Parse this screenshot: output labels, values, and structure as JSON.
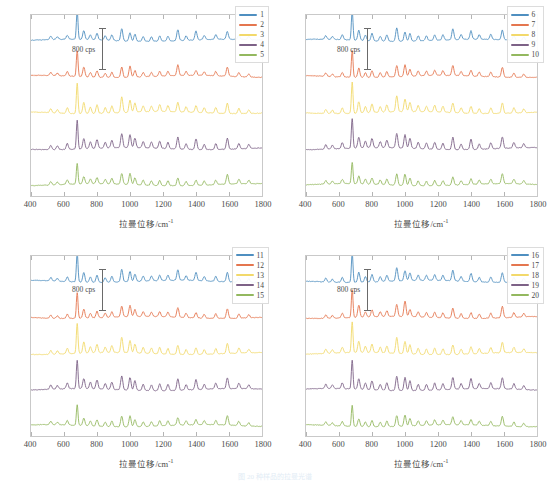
{
  "figure": {
    "caption": "图 20 种样品的拉曼光谱",
    "background_color": "#ffffff",
    "frame_color": "#c9c9c9"
  },
  "axis": {
    "x_title_main": "拉曼位移/cm",
    "x_title_sup": "-1",
    "x_ticks": [
      "400",
      "600",
      "800",
      "1000",
      "1200",
      "1400",
      "1600",
      "1800"
    ],
    "x_min": 400,
    "x_max": 1800,
    "y_ticks_shown": false
  },
  "scalebar": {
    "label": "800 cps"
  },
  "series_colors": {
    "c1": "#4f8fc0",
    "c2": "#e4764f",
    "c3": "#f2d96b",
    "c4": "#7d6287",
    "c5": "#93b85f"
  },
  "panels": [
    {
      "id": "panel-top-left",
      "legend": [
        {
          "label": "1",
          "color": "#4f8fc0"
        },
        {
          "label": "2",
          "color": "#e4764f"
        },
        {
          "label": "3",
          "color": "#f2d96b"
        },
        {
          "label": "4",
          "color": "#7d6287"
        },
        {
          "label": "5",
          "color": "#93b85f"
        }
      ]
    },
    {
      "id": "panel-top-right",
      "legend": [
        {
          "label": "6",
          "color": "#4f8fc0"
        },
        {
          "label": "7",
          "color": "#e4764f"
        },
        {
          "label": "8",
          "color": "#f2d96b"
        },
        {
          "label": "9",
          "color": "#7d6287"
        },
        {
          "label": "10",
          "color": "#93b85f"
        }
      ]
    },
    {
      "id": "panel-bottom-left",
      "legend": [
        {
          "label": "11",
          "color": "#4f8fc0"
        },
        {
          "label": "12",
          "color": "#e4764f"
        },
        {
          "label": "13",
          "color": "#f2d96b"
        },
        {
          "label": "14",
          "color": "#7d6287"
        },
        {
          "label": "15",
          "color": "#93b85f"
        }
      ]
    },
    {
      "id": "panel-bottom-right",
      "legend": [
        {
          "label": "16",
          "color": "#4f8fc0"
        },
        {
          "label": "17",
          "color": "#e4764f"
        },
        {
          "label": "18",
          "color": "#f2d96b"
        },
        {
          "label": "19",
          "color": "#7d6287"
        },
        {
          "label": "20",
          "color": "#93b85f"
        }
      ]
    }
  ],
  "chart_data": {
    "type": "line",
    "title": "",
    "xlabel": "拉曼位移/cm-1",
    "ylabel": "",
    "xlim": [
      400,
      1800
    ],
    "grid": false,
    "legend_position": "top-right",
    "y_axis_labeled": false,
    "scale_bar": "800 cps",
    "note": "Four stacked-offset Raman spectra panels; each panel holds 5 traces offset vertically. Intensity in arbitrary counts per second; peak list gives Raman shift (cm-1) and relative peak height in cps above local baseline.",
    "peak_positions_cm1": [
      520,
      560,
      620,
      680,
      720,
      760,
      800,
      850,
      890,
      950,
      1000,
      1030,
      1080,
      1130,
      1180,
      1230,
      1290,
      1340,
      1400,
      1450,
      1520,
      1590,
      1660,
      1720
    ],
    "panels": [
      {
        "name": "panel-top-left",
        "series": [
          {
            "name": "1",
            "color": "#4f8fc0",
            "offset": 4,
            "peaks_cps": [
              90,
              70,
              110,
              760,
              240,
              130,
              180,
              120,
              150,
              330,
              220,
              190,
              130,
              120,
              140,
              130,
              300,
              120,
              240,
              110,
              130,
              210,
              120,
              90
            ]
          },
          {
            "name": "2",
            "color": "#e4764f",
            "offset": 3,
            "peaks_cps": [
              80,
              70,
              120,
              700,
              260,
              120,
              170,
              110,
              140,
              280,
              300,
              180,
              120,
              110,
              130,
              120,
              290,
              110,
              130,
              100,
              120,
              250,
              110,
              80
            ]
          },
          {
            "name": "3",
            "color": "#f2d96b",
            "offset": 2,
            "peaks_cps": [
              110,
              90,
              150,
              820,
              300,
              170,
              230,
              150,
              190,
              420,
              330,
              240,
              160,
              150,
              180,
              160,
              250,
              140,
              180,
              130,
              150,
              280,
              140,
              100
            ]
          },
          {
            "name": "4",
            "color": "#7d6287",
            "offset": 1,
            "peaks_cps": [
              120,
              100,
              160,
              780,
              280,
              180,
              240,
              160,
              200,
              380,
              350,
              260,
              170,
              160,
              190,
              170,
              320,
              150,
              290,
              140,
              160,
              300,
              150,
              110
            ]
          },
          {
            "name": "5",
            "color": "#93b85f",
            "offset": 0,
            "peaks_cps": [
              90,
              70,
              120,
              560,
              200,
              130,
              170,
              120,
              150,
              290,
              300,
              190,
              130,
              120,
              140,
              130,
              210,
              110,
              140,
              110,
              120,
              260,
              120,
              90
            ]
          }
        ]
      },
      {
        "name": "panel-top-right",
        "series": [
          {
            "name": "6",
            "color": "#4f8fc0",
            "offset": 4,
            "peaks_cps": [
              100,
              80,
              130,
              800,
              270,
              150,
              200,
              130,
              170,
              360,
              250,
              210,
              140,
              130,
              150,
              140,
              290,
              130,
              230,
              120,
              140,
              260,
              130,
              100
            ]
          },
          {
            "name": "7",
            "color": "#e4764f",
            "offset": 3,
            "peaks_cps": [
              90,
              70,
              120,
              720,
              250,
              130,
              180,
              120,
              150,
              300,
              310,
              190,
              130,
              120,
              140,
              130,
              270,
              120,
              150,
              110,
              130,
              270,
              120,
              90
            ]
          },
          {
            "name": "8",
            "color": "#f2d96b",
            "offset": 2,
            "peaks_cps": [
              110,
              90,
              150,
              840,
              310,
              170,
              230,
              150,
              190,
              430,
              340,
              250,
              160,
              150,
              180,
              160,
              260,
              140,
              190,
              130,
              150,
              290,
              140,
              100
            ]
          },
          {
            "name": "9",
            "color": "#7d6287",
            "offset": 1,
            "peaks_cps": [
              120,
              100,
              160,
              800,
              290,
              180,
              250,
              160,
              200,
              390,
              360,
              270,
              170,
              160,
              190,
              170,
              330,
              150,
              280,
              140,
              160,
              310,
              150,
              110
            ]
          },
          {
            "name": "10",
            "color": "#93b85f",
            "offset": 0,
            "peaks_cps": [
              90,
              70,
              120,
              580,
              210,
              130,
              170,
              120,
              150,
              300,
              310,
              200,
              130,
              120,
              140,
              130,
              220,
              110,
              150,
              110,
              120,
              270,
              120,
              90
            ]
          }
        ]
      },
      {
        "name": "panel-bottom-left",
        "series": [
          {
            "name": "11",
            "color": "#4f8fc0",
            "offset": 4,
            "peaks_cps": [
              95,
              75,
              125,
              780,
              260,
              140,
              190,
              125,
              160,
              340,
              280,
              200,
              135,
              125,
              145,
              135,
              280,
              125,
              220,
              115,
              135,
              250,
              125,
              95
            ]
          },
          {
            "name": "12",
            "color": "#e4764f",
            "offset": 3,
            "peaks_cps": [
              85,
              70,
              115,
              700,
              240,
              125,
              175,
              115,
              145,
              290,
              300,
              185,
              125,
              115,
              135,
              125,
              260,
              115,
              145,
              105,
              125,
              260,
              115,
              85
            ]
          },
          {
            "name": "13",
            "color": "#f2d96b",
            "offset": 2,
            "peaks_cps": [
              105,
              85,
              145,
              810,
              300,
              165,
              225,
              145,
              185,
              410,
              330,
              240,
              155,
              145,
              175,
              155,
              250,
              135,
              185,
              125,
              145,
              275,
              135,
              95
            ]
          },
          {
            "name": "14",
            "color": "#7d6287",
            "offset": 1,
            "peaks_cps": [
              115,
              95,
              155,
              770,
              275,
              175,
              240,
              155,
              195,
              375,
              345,
              260,
              165,
              155,
              185,
              165,
              315,
              145,
              275,
              135,
              155,
              295,
              145,
              105
            ]
          },
          {
            "name": "15",
            "color": "#93b85f",
            "offset": 0,
            "peaks_cps": [
              88,
              68,
              118,
              560,
              200,
              128,
              168,
              118,
              148,
              285,
              295,
              188,
              128,
              118,
              138,
              128,
              205,
              108,
              138,
              108,
              118,
              255,
              118,
              88
            ]
          }
        ]
      },
      {
        "name": "panel-bottom-right",
        "series": [
          {
            "name": "16",
            "color": "#4f8fc0",
            "offset": 4,
            "peaks_cps": [
              100,
              80,
              130,
              790,
              265,
              145,
              195,
              130,
              165,
              350,
              270,
              205,
              140,
              130,
              150,
              140,
              285,
              130,
              225,
              120,
              140,
              255,
              130,
              100
            ]
          },
          {
            "name": "17",
            "color": "#e4764f",
            "offset": 3,
            "peaks_cps": [
              95,
              75,
              125,
              760,
              330,
              135,
              185,
              125,
              155,
              320,
              420,
              195,
              135,
              125,
              145,
              135,
              270,
              125,
              155,
              115,
              135,
              310,
              125,
              95
            ]
          },
          {
            "name": "18",
            "color": "#f2d96b",
            "offset": 2,
            "peaks_cps": [
              110,
              90,
              150,
              830,
              305,
              170,
              230,
              150,
              190,
              425,
              335,
              245,
              160,
              150,
              180,
              160,
              255,
              140,
              190,
              130,
              150,
              285,
              140,
              100
            ]
          },
          {
            "name": "19",
            "color": "#7d6287",
            "offset": 1,
            "peaks_cps": [
              118,
              98,
              158,
              785,
              285,
              178,
              245,
              158,
              198,
              385,
              355,
              265,
              168,
              158,
              188,
              168,
              325,
              148,
              278,
              138,
              158,
              305,
              148,
              108
            ]
          },
          {
            "name": "20",
            "color": "#93b85f",
            "offset": 0,
            "peaks_cps": [
              90,
              70,
              120,
              570,
              205,
              130,
              170,
              120,
              150,
              295,
              300,
              195,
              130,
              120,
              140,
              130,
              215,
              110,
              145,
              110,
              120,
              265,
              120,
              90
            ]
          }
        ]
      }
    ]
  }
}
